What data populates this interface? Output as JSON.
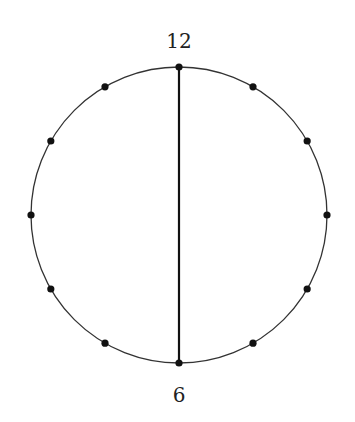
{
  "diagram": {
    "type": "clock-circle",
    "center": {
      "x": 179,
      "y": 215
    },
    "radius": 148,
    "point_count": 12,
    "labels": {
      "top": "12",
      "bottom": "6"
    },
    "chord": {
      "from": "12",
      "to": "6"
    },
    "colors": {
      "stroke": "#222222",
      "dots": "#111111",
      "background": "#ffffff"
    }
  }
}
